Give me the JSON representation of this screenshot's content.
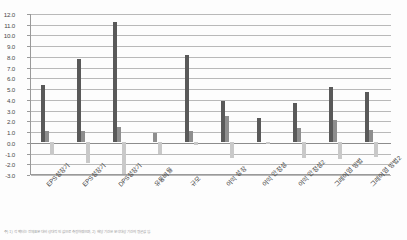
{
  "chart_data": {
    "type": "bar",
    "title": "",
    "subtitle": "",
    "xlabel": "",
    "ylabel": "",
    "ylim": [
      -3.0,
      12.0
    ],
    "ytick_step": 1.0,
    "grid": true,
    "legend_position": "none",
    "orientation": "vertical",
    "grouping": "grouped",
    "categories": [
      "EPS성장기",
      "EPS성장기",
      "DPS성장기",
      "유동비율",
      "규모",
      "이익 성장",
      "이익 안정성",
      "이익 안정성2",
      "그레이엄 방법",
      "그레이엄 방법2"
    ],
    "ytick_labels": [
      "12.0",
      "11.0",
      "10.0",
      "9.0",
      "8.0",
      "7.0",
      "6.0",
      "5.0",
      "4.0",
      "3.0",
      "2.0",
      "1.0",
      "0.0",
      "-1.0",
      "-2.0",
      "-3.0"
    ],
    "series": [
      {
        "name": "series-1",
        "color": "#595959",
        "values": [
          5.3,
          7.7,
          11.2,
          0.0,
          8.1,
          3.8,
          2.2,
          3.6,
          5.1,
          4.6
        ]
      },
      {
        "name": "series-2",
        "color": "#8e8e8e",
        "values": [
          1.0,
          1.0,
          1.4,
          0.8,
          1.0,
          2.4,
          0.0,
          1.3,
          2.0,
          1.1
        ]
      },
      {
        "name": "series-3",
        "color": "#c9c9c9",
        "values": [
          -1.2,
          -2.0,
          -3.0,
          -1.1,
          -0.3,
          -1.5,
          -0.2,
          -1.5,
          -1.6,
          -1.4
        ]
      }
    ]
  },
  "caption": {
    "text": "주) 1) 각 팩터는 전체표본 대비 상대적인 값으로 측정하였으며, 2) 해당 기간은 분석대상 기간의 평균값임."
  }
}
